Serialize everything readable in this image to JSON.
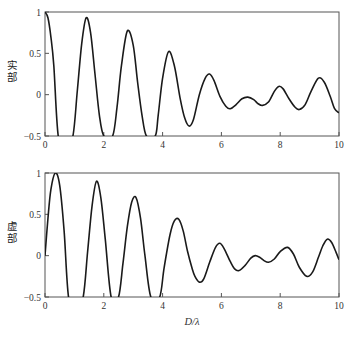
{
  "chart_data": [
    {
      "type": "line",
      "panel": "top",
      "title": "",
      "xlabel": "",
      "ylabel": "实部",
      "xlim": [
        0,
        10
      ],
      "ylim": [
        -0.5,
        1
      ],
      "xticks": [
        0,
        2,
        4,
        6,
        8,
        10
      ],
      "yticks": [
        -0.5,
        0,
        0.5,
        1
      ],
      "ytick_labels": [
        "-0.5",
        "0",
        "0.5",
        "1"
      ],
      "grid": false,
      "legend": null,
      "series": [
        {
          "name": "实部",
          "x": [
            0,
            0.1,
            0.2,
            0.3,
            0.45,
            0.7,
            0.95,
            1.1,
            1.25,
            1.4,
            1.55,
            1.7,
            1.85,
            2.0,
            2.3,
            2.45,
            2.6,
            2.8,
            3.0,
            3.15,
            3.3,
            3.45,
            3.75,
            3.85,
            4.0,
            4.2,
            4.4,
            4.6,
            4.75,
            4.9,
            5.05,
            5.25,
            5.45,
            5.6,
            5.75,
            5.95,
            6.15,
            6.3,
            6.5,
            6.7,
            6.9,
            7.1,
            7.25,
            7.4,
            7.6,
            7.8,
            7.95,
            8.1,
            8.3,
            8.5,
            8.65,
            8.85,
            9.05,
            9.3,
            9.5,
            9.7,
            9.85,
            10
          ],
          "y": [
            1,
            0.93,
            0.7,
            0.35,
            -0.5,
            -0.7,
            -0.5,
            0.05,
            0.62,
            0.93,
            0.75,
            0.25,
            -0.25,
            -0.5,
            -0.5,
            -0.15,
            0.35,
            0.77,
            0.6,
            0.15,
            -0.25,
            -0.5,
            -0.5,
            -0.25,
            0.2,
            0.52,
            0.35,
            -0.05,
            -0.28,
            -0.38,
            -0.3,
            0.0,
            0.2,
            0.25,
            0.17,
            -0.02,
            -0.14,
            -0.17,
            -0.12,
            -0.05,
            -0.03,
            -0.06,
            -0.11,
            -0.13,
            -0.09,
            0.04,
            0.1,
            0.07,
            -0.05,
            -0.15,
            -0.18,
            -0.12,
            0.04,
            0.2,
            0.15,
            -0.02,
            -0.17,
            -0.22
          ]
        }
      ]
    },
    {
      "type": "line",
      "panel": "bottom",
      "title": "",
      "xlabel": "D/λ",
      "ylabel": "虚部",
      "xlim": [
        0,
        10
      ],
      "ylim": [
        -0.5,
        1
      ],
      "xticks": [
        0,
        2,
        4,
        6,
        8,
        10
      ],
      "yticks": [
        -0.5,
        0,
        0.5,
        1
      ],
      "ytick_labels": [
        "-0.5",
        "0",
        "0.5",
        "1"
      ],
      "grid": false,
      "legend": null,
      "series": [
        {
          "name": "虚部",
          "x": [
            0,
            0.1,
            0.2,
            0.35,
            0.5,
            0.65,
            0.8,
            1.05,
            1.3,
            1.45,
            1.6,
            1.75,
            1.9,
            2.05,
            2.25,
            2.5,
            2.65,
            2.8,
            2.95,
            3.1,
            3.25,
            3.4,
            3.6,
            3.9,
            4.05,
            4.25,
            4.4,
            4.55,
            4.7,
            4.85,
            5.0,
            5.1,
            5.25,
            5.4,
            5.6,
            5.8,
            5.95,
            6.1,
            6.3,
            6.45,
            6.6,
            6.8,
            7.0,
            7.15,
            7.3,
            7.45,
            7.6,
            7.8,
            8.0,
            8.25,
            8.45,
            8.65,
            8.9,
            9.1,
            9.3,
            9.45,
            9.6,
            9.75,
            9.9,
            10
          ],
          "y": [
            0,
            0.45,
            0.8,
            1.0,
            0.85,
            0.3,
            -0.5,
            -0.75,
            -0.5,
            0.05,
            0.6,
            0.9,
            0.7,
            0.2,
            -0.5,
            -0.5,
            -0.1,
            0.35,
            0.65,
            0.7,
            0.45,
            0.0,
            -0.5,
            -0.5,
            -0.15,
            0.25,
            0.42,
            0.44,
            0.3,
            0.05,
            -0.15,
            -0.25,
            -0.32,
            -0.28,
            -0.08,
            0.1,
            0.15,
            0.08,
            -0.07,
            -0.16,
            -0.18,
            -0.12,
            -0.03,
            0.0,
            -0.02,
            -0.06,
            -0.08,
            -0.04,
            0.05,
            0.1,
            0.02,
            -0.14,
            -0.25,
            -0.2,
            -0.02,
            0.12,
            0.2,
            0.16,
            0.04,
            -0.05
          ]
        }
      ]
    }
  ],
  "figure": {
    "panels": [
      {
        "id": "top",
        "ylabel": "实部",
        "xtick_labels": [
          "0",
          "2",
          "4",
          "6",
          "8",
          "10"
        ],
        "ytick_labels": [
          "1",
          "0.5",
          "0",
          "−0.5"
        ]
      },
      {
        "id": "bottom",
        "ylabel": "虚部",
        "xtick_labels": [
          "0",
          "2",
          "4",
          "6",
          "8",
          "10"
        ],
        "ytick_labels": [
          "1",
          "0.5",
          "0",
          "−0.5"
        ]
      }
    ],
    "xlabel": "D/λ",
    "colors": {
      "line": "#1a1a1a",
      "frame": "#555555",
      "background": "#ffffff"
    }
  }
}
